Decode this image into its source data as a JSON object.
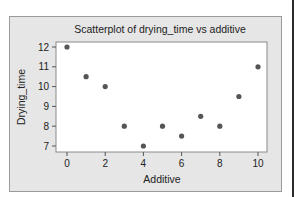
{
  "chart_data": {
    "type": "scatter",
    "title": "Scatterplot of drying_time vs additive",
    "xlabel": "Additive",
    "ylabel": "Drying_time",
    "x": [
      0,
      1,
      2,
      3,
      4,
      5,
      6,
      7,
      8,
      9,
      10
    ],
    "y": [
      12,
      10.5,
      10,
      8,
      7,
      8,
      7.5,
      8.5,
      8,
      9.5,
      11
    ],
    "xlim": [
      -0.6,
      10.5
    ],
    "ylim": [
      6.7,
      12.3
    ],
    "xticks": [
      0,
      2,
      4,
      6,
      8,
      10
    ],
    "yticks": [
      7,
      8,
      9,
      10,
      11,
      12
    ],
    "grid": false,
    "legend": null,
    "marker_color": "#555555",
    "plot_background": "#ffffff",
    "frame_background": "#e6e6e6"
  }
}
